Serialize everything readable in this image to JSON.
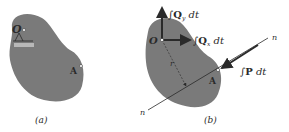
{
  "figure_a": {
    "caption": "(a)",
    "point_O": "O",
    "point_A": "A"
  },
  "figure_b": {
    "caption": "(b)",
    "point_O": "O",
    "point_A": "A",
    "radius_label": "r",
    "line_label_left": "n",
    "line_label_right": "n",
    "force_Qy": {
      "integral": "∫",
      "symbol": "Q",
      "sub": "y",
      "suffix": " dt"
    },
    "force_Qx": {
      "integral": "∫",
      "symbol": "Q",
      "sub": "x",
      "suffix": " dt"
    },
    "force_P": {
      "integral": "∫",
      "symbol": "P",
      "suffix": " dt"
    }
  },
  "colors": {
    "body_fill": "#7a7a7a",
    "line": "#2a2a2a",
    "text": "#2a2a2a"
  }
}
